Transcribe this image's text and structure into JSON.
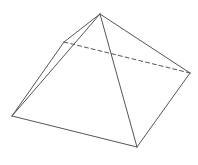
{
  "diagram": {
    "type": "square-pyramid-wireframe",
    "stroke_color": "#555555",
    "background": "#ffffff",
    "vertices": {
      "apex": [
        100,
        14
      ],
      "back_left": [
        64,
        42
      ],
      "right": [
        190,
        73
      ],
      "left": [
        12,
        116
      ],
      "front": [
        137,
        147
      ]
    },
    "edges": [
      {
        "name": "apex-left",
        "from": "apex",
        "to": "left",
        "hidden": false
      },
      {
        "name": "apex-back-left",
        "from": "apex",
        "to": "back_left",
        "hidden": false
      },
      {
        "name": "apex-right",
        "from": "apex",
        "to": "right",
        "hidden": false
      },
      {
        "name": "apex-front",
        "from": "apex",
        "to": "front",
        "hidden": false
      },
      {
        "name": "back-left-left",
        "from": "back_left",
        "to": "left",
        "hidden": false
      },
      {
        "name": "left-front",
        "from": "left",
        "to": "front",
        "hidden": false
      },
      {
        "name": "front-right",
        "from": "front",
        "to": "right",
        "hidden": false
      },
      {
        "name": "back-left-right",
        "from": "back_left",
        "to": "right",
        "hidden": true
      }
    ]
  }
}
